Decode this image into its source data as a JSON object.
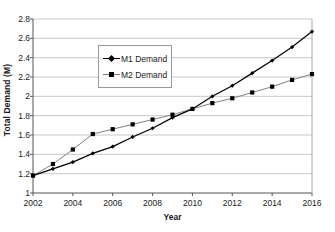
{
  "chart_data": {
    "type": "line",
    "title": "",
    "xlabel": "Year",
    "ylabel": "Total Demand (M)",
    "x": [
      2002,
      2003,
      2004,
      2005,
      2006,
      2007,
      2008,
      2009,
      2010,
      2011,
      2012,
      2013,
      2014,
      2015,
      2016
    ],
    "xlim": [
      2002,
      2016
    ],
    "ylim": [
      1,
      2.8
    ],
    "xticks": [
      "2002",
      "2004",
      "2006",
      "2008",
      "2010",
      "2012",
      "2014",
      "2016"
    ],
    "xtick_values": [
      2002,
      2004,
      2006,
      2008,
      2010,
      2012,
      2014,
      2016
    ],
    "yticks": [
      "1",
      "1.2",
      "1.4",
      "1.6",
      "1.8",
      "2",
      "2.2",
      "2.4",
      "2.6",
      "2.8"
    ],
    "ytick_values": [
      1,
      1.2,
      1.4,
      1.6,
      1.8,
      2,
      2.2,
      2.4,
      2.6,
      2.8
    ],
    "grid": "horizontal",
    "legend_position": "inside-upper-left",
    "series": [
      {
        "name": "M1 Demand",
        "marker": "diamond",
        "color": "#000000",
        "values": [
          1.18,
          1.25,
          1.32,
          1.41,
          1.48,
          1.58,
          1.67,
          1.78,
          1.87,
          2.0,
          2.11,
          2.24,
          2.37,
          2.51,
          2.67
        ]
      },
      {
        "name": "M2 Demand",
        "marker": "square",
        "color": "#808080",
        "values": [
          1.18,
          1.3,
          1.45,
          1.61,
          1.66,
          1.71,
          1.76,
          1.81,
          1.87,
          1.93,
          1.98,
          2.04,
          2.1,
          2.17,
          2.23
        ]
      }
    ]
  },
  "legend": {
    "entries": [
      {
        "label": "M1 Demand"
      },
      {
        "label": "M2 Demand"
      }
    ]
  },
  "axes": {
    "x_title": "Year",
    "y_title": "Total Demand (M)"
  },
  "colors": {
    "m1": "#000000",
    "m2": "#808080",
    "grid": "#c8c8c8",
    "axis": "#555555",
    "legend_border": "#9a9a9a",
    "background": "#ffffff"
  }
}
